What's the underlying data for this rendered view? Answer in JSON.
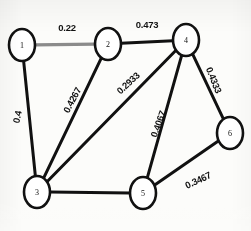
{
  "figure": {
    "background_color": "#fcfcfa",
    "edge_color": "#111111",
    "node_fill": "#ffffff",
    "node_stroke": "#111111"
  },
  "chart_data": {
    "type": "diagram",
    "diagram_kind": "weighted-undirected-graph",
    "node_count": 6,
    "edge_count": 8,
    "nodes": [
      {
        "id": "1",
        "label": "1",
        "x": 22,
        "y": 45
      },
      {
        "id": "2",
        "label": "2",
        "x": 108,
        "y": 44
      },
      {
        "id": "3",
        "label": "3",
        "x": 37,
        "y": 192
      },
      {
        "id": "4",
        "label": "4",
        "x": 186,
        "y": 40
      },
      {
        "id": "5",
        "label": "5",
        "x": 143,
        "y": 193
      },
      {
        "id": "6",
        "label": "6",
        "x": 230,
        "y": 133
      }
    ],
    "edges": [
      {
        "source": "1",
        "target": "2",
        "weight": "0.22",
        "label_x": 67,
        "label_y": 27,
        "rotation": 0,
        "style": "gray"
      },
      {
        "source": "2",
        "target": "4",
        "weight": "0.473",
        "label_x": 147,
        "label_y": 24,
        "rotation": 0,
        "style": "solid"
      },
      {
        "source": "1",
        "target": "3",
        "weight": "0.4",
        "label_x": 17,
        "label_y": 117,
        "rotation": -78,
        "style": "solid"
      },
      {
        "source": "2",
        "target": "3",
        "weight": "0.4267",
        "label_x": 72,
        "label_y": 100,
        "rotation": -62,
        "style": "solid"
      },
      {
        "source": "3",
        "target": "4",
        "weight": "0.2933",
        "label_x": 128,
        "label_y": 83,
        "rotation": -43,
        "style": "solid"
      },
      {
        "source": "4",
        "target": "5",
        "weight": "0.4067",
        "label_x": 158,
        "label_y": 124,
        "rotation": -70,
        "style": "solid"
      },
      {
        "source": "4",
        "target": "6",
        "weight": "0.4333",
        "label_x": 214,
        "label_y": 80,
        "rotation": 68,
        "style": "solid"
      },
      {
        "source": "5",
        "target": "6",
        "weight": "0.3467",
        "label_x": 198,
        "label_y": 180,
        "rotation": -25,
        "style": "solid"
      },
      {
        "source": "3",
        "target": "5",
        "weight": "",
        "label_x": 90,
        "label_y": 205,
        "rotation": 0,
        "style": "solid"
      }
    ],
    "node_radius_x": 13,
    "node_radius_y": 16
  }
}
